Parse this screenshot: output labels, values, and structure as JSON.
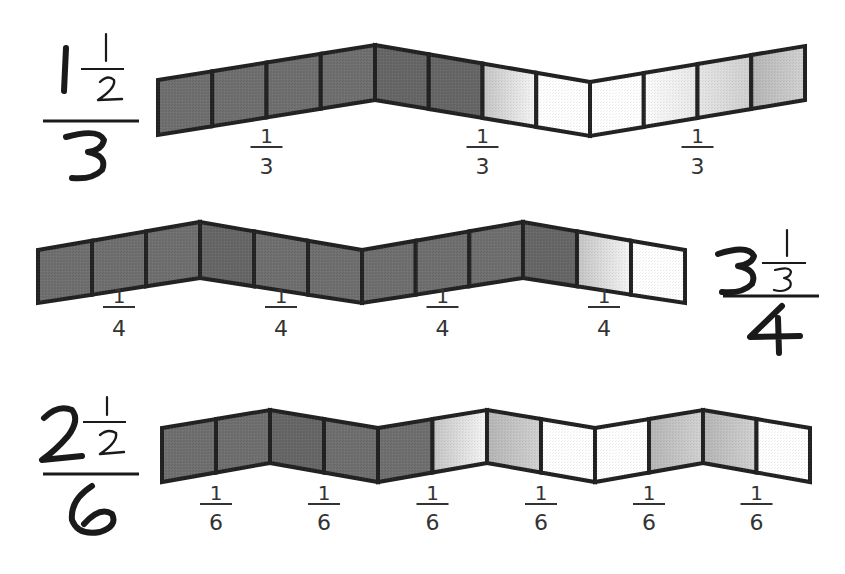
{
  "colors": {
    "outline": "#222222",
    "dark": "#6f6f6f",
    "dark_alt": "#666666",
    "medium": "#9a9a9a",
    "light": "#c8c8c8",
    "very_light": "#e6e6e6",
    "white": "#ffffff"
  },
  "rows": [
    {
      "id": "row-1",
      "big_fraction": {
        "whole": "1",
        "num": "1",
        "den_small": "2",
        "denominator": "3",
        "side": "left"
      },
      "cells_per_segment": 4,
      "segments": 3,
      "segment_label": {
        "num": "1",
        "den": "3"
      },
      "fills": [
        "dark",
        "dark",
        "dark",
        "dark",
        "dark_alt",
        "dark_alt",
        "grad_light",
        "white",
        "white",
        "grad_vlight",
        "grad_light2",
        "grad_mid"
      ]
    },
    {
      "id": "row-2",
      "big_fraction": {
        "whole": "3",
        "num": "1",
        "den_small": "3",
        "denominator": "4",
        "side": "right"
      },
      "cells_per_segment": 3,
      "segments": 4,
      "segment_label": {
        "num": "1",
        "den": "4"
      },
      "fills": [
        "dark",
        "dark",
        "dark",
        "dark_alt",
        "dark",
        "dark",
        "dark",
        "dark",
        "dark",
        "dark_alt",
        "grad_light",
        "white"
      ]
    },
    {
      "id": "row-3",
      "big_fraction": {
        "whole": "2",
        "num": "1",
        "den_small": "2",
        "denominator": "6",
        "side": "left"
      },
      "cells_per_segment": 2,
      "segments": 6,
      "segment_label": {
        "num": "1",
        "den": "6"
      },
      "fills": [
        "dark",
        "dark",
        "dark_alt",
        "dark",
        "dark",
        "grad_light",
        "grad_mid",
        "white",
        "white",
        "grad_mid",
        "grad_mid",
        "white"
      ]
    }
  ]
}
